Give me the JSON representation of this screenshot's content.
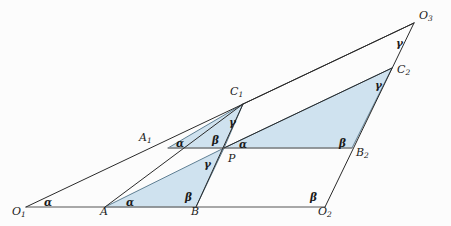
{
  "figure": {
    "canvas": {
      "width": 451,
      "height": 226
    },
    "colors": {
      "background": "#fcfcfc",
      "stroke": "#2a2a2a",
      "baseline_stroke": "#8c8c8c",
      "fill": "#cfe2ef",
      "fill_stroke": "#5f7f93",
      "label": "#1a1a1a"
    },
    "stroke_width": 1.0
  },
  "chart_data": {
    "type": "diagram",
    "points": [
      {
        "name": "O1",
        "label": "O",
        "sub": "1",
        "x": 26,
        "y": 207,
        "label_x": 12,
        "label_y": 206
      },
      {
        "name": "A",
        "label": "A",
        "sub": "",
        "x": 105,
        "y": 207,
        "label_x": 100,
        "label_y": 206
      },
      {
        "name": "B",
        "label": "B",
        "sub": "",
        "x": 196,
        "y": 207,
        "label_x": 191,
        "label_y": 206
      },
      {
        "name": "O2",
        "label": "O",
        "sub": "2",
        "x": 325,
        "y": 207,
        "label_x": 318,
        "label_y": 206
      },
      {
        "name": "A1",
        "label": "A",
        "sub": "1",
        "x": 168,
        "y": 148,
        "label_x": 139,
        "label_y": 132
      },
      {
        "name": "P",
        "label": "P",
        "sub": "",
        "x": 224,
        "y": 148,
        "label_x": 228,
        "label_y": 153
      },
      {
        "name": "B2",
        "label": "B",
        "sub": "2",
        "x": 352,
        "y": 148,
        "label_x": 356,
        "label_y": 147
      },
      {
        "name": "C1",
        "label": "C",
        "sub": "1",
        "x": 243,
        "y": 104,
        "label_x": 230,
        "label_y": 86
      },
      {
        "name": "C2",
        "label": "C",
        "sub": "2",
        "x": 392,
        "y": 68,
        "label_x": 397,
        "label_y": 64
      },
      {
        "name": "O3",
        "label": "O",
        "sub": "3",
        "x": 414,
        "y": 23,
        "label_x": 419,
        "label_y": 10
      }
    ],
    "shaded_triangles": [
      {
        "name": "triangle-A1-P-C1",
        "vertices": [
          "A1",
          "P",
          "C1"
        ]
      },
      {
        "name": "triangle-A-B-P",
        "vertices": [
          "A",
          "B",
          "P"
        ]
      },
      {
        "name": "triangle-P-B2-C2",
        "vertices": [
          "P",
          "B2",
          "C2"
        ]
      }
    ],
    "baselines": [
      {
        "name": "baseline-O1-O2",
        "from": "O1",
        "to": "O2"
      },
      {
        "name": "baseline-A1-B2",
        "from": "A1",
        "to": "B2"
      }
    ],
    "segments": [
      {
        "name": "segment-O1-O3",
        "from": "O1",
        "to": "O3"
      },
      {
        "name": "segment-A-C1",
        "from": "A",
        "to": "C1"
      },
      {
        "name": "segment-P-C2",
        "from": "P",
        "to": "C2"
      },
      {
        "name": "segment-B-C1",
        "from": "B",
        "to": "C1"
      },
      {
        "name": "segment-O2-O3",
        "from": "O2",
        "to": "O3"
      },
      {
        "name": "segment-C1-O3",
        "from": "C1",
        "to": "O3"
      }
    ],
    "angle_marks": [
      {
        "name": "angle-alpha-at-O1",
        "symbol": "α",
        "x": 44,
        "y": 197,
        "at": "O1"
      },
      {
        "name": "angle-alpha-at-A",
        "symbol": "α",
        "x": 126,
        "y": 197,
        "at": "A"
      },
      {
        "name": "angle-beta-at-B",
        "symbol": "β",
        "x": 185,
        "y": 192,
        "at": "B"
      },
      {
        "name": "angle-beta-at-O2",
        "symbol": "β",
        "x": 310,
        "y": 192,
        "at": "O2"
      },
      {
        "name": "angle-alpha-at-A1",
        "symbol": "α",
        "x": 176,
        "y": 138,
        "at": "A1"
      },
      {
        "name": "angle-beta-at-P",
        "symbol": "β",
        "x": 212,
        "y": 135,
        "at": "P"
      },
      {
        "name": "angle-alpha-at-P",
        "symbol": "α",
        "x": 239,
        "y": 139,
        "at": "P"
      },
      {
        "name": "angle-gamma-at-P",
        "symbol": "γ",
        "x": 204,
        "y": 159,
        "at": "P"
      },
      {
        "name": "angle-beta-at-B2",
        "symbol": "β",
        "x": 339,
        "y": 138,
        "at": "B2"
      },
      {
        "name": "angle-gamma-at-C1",
        "symbol": "γ",
        "x": 229,
        "y": 117,
        "at": "C1"
      },
      {
        "name": "angle-gamma-at-C2",
        "symbol": "γ",
        "x": 375,
        "y": 80,
        "at": "C2"
      },
      {
        "name": "angle-gamma-at-O3",
        "symbol": "γ",
        "x": 396,
        "y": 38,
        "at": "O3"
      }
    ],
    "legend": {
      "alpha": "α",
      "beta": "β",
      "gamma": "γ"
    }
  }
}
